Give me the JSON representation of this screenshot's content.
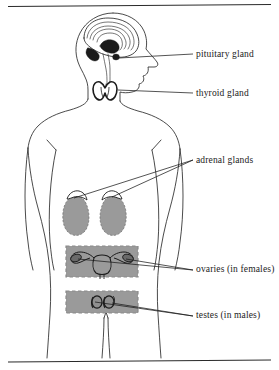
{
  "figure": {
    "rules": {
      "top_rule": "",
      "bottom_rule": ""
    },
    "colors": {
      "ink": "#1b1b1b",
      "outline": "#2a2a2a",
      "organ_gray": "#9a9a9a",
      "panel_gray": "#9a9a9a",
      "panel_dash": "#8a8a8a",
      "background": "#ffffff",
      "gland_highlight": "#ffffff"
    },
    "labels": [
      {
        "id": "pituitary",
        "text": "pituitary gland",
        "x": 196,
        "y": 57,
        "organ": "pituitary-gland"
      },
      {
        "id": "thyroid",
        "text": "thyroid gland",
        "x": 196,
        "y": 96,
        "organ": "thyroid-gland"
      },
      {
        "id": "adrenal",
        "text": "adrenal glands",
        "x": 196,
        "y": 163,
        "organ": "adrenal-glands"
      },
      {
        "id": "ovaries",
        "text": "ovaries (in females)",
        "x": 196,
        "y": 272,
        "organ": "ovaries"
      },
      {
        "id": "testes",
        "text": "testes (in males)",
        "x": 196,
        "y": 318,
        "organ": "testes"
      }
    ],
    "organs": [
      {
        "id": "brain",
        "name": "brain-cross-section"
      },
      {
        "id": "pituitary-gland",
        "name": "pituitary-gland"
      },
      {
        "id": "thyroid-gland",
        "name": "thyroid-gland"
      },
      {
        "id": "kidney-left",
        "name": "kidney"
      },
      {
        "id": "kidney-right",
        "name": "kidney"
      },
      {
        "id": "adrenal-left",
        "name": "adrenal-gland"
      },
      {
        "id": "adrenal-right",
        "name": "adrenal-gland"
      },
      {
        "id": "uterus-ovaries",
        "name": "uterus-with-ovaries"
      },
      {
        "id": "testes-pair",
        "name": "testes"
      }
    ]
  }
}
